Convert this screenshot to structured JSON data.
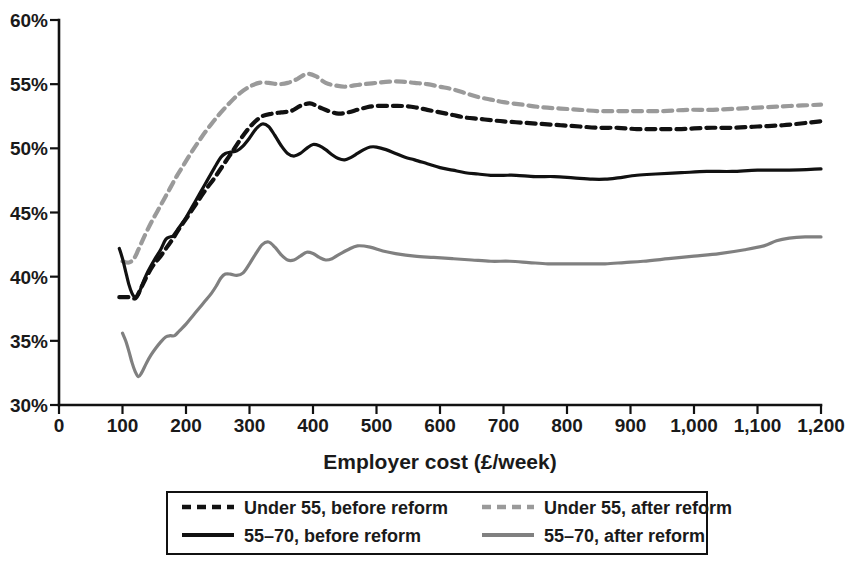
{
  "chart_data": {
    "type": "line",
    "title": "",
    "xlabel": "Employer cost (£/week)",
    "ylabel": "",
    "xlim": [
      0,
      1200
    ],
    "ylim": [
      30,
      60
    ],
    "grid": false,
    "legend_position": "bottom",
    "x_ticks": [
      0,
      100,
      200,
      300,
      400,
      500,
      600,
      700,
      800,
      900,
      1000,
      1100,
      1200
    ],
    "x_tick_labels": [
      "0",
      "100",
      "200",
      "300",
      "400",
      "500",
      "600",
      "700",
      "800",
      "900",
      "1,000",
      "1,100",
      "1,200"
    ],
    "y_ticks": [
      30,
      35,
      40,
      45,
      50,
      55,
      60
    ],
    "y_tick_labels": [
      "30%",
      "35%",
      "40%",
      "45%",
      "50%",
      "55%",
      "60%"
    ],
    "series": [
      {
        "name": "Under 55, before reform",
        "style": "dashed",
        "color": "#111111",
        "x": [
          95,
          100,
          110,
          118,
          122,
          130,
          140,
          150,
          160,
          170,
          180,
          190,
          200,
          215,
          230,
          245,
          260,
          275,
          290,
          305,
          320,
          335,
          350,
          365,
          380,
          395,
          410,
          425,
          440,
          455,
          470,
          485,
          500,
          520,
          540,
          560,
          580,
          600,
          620,
          640,
          660,
          680,
          700,
          730,
          760,
          790,
          820,
          850,
          880,
          910,
          940,
          980,
          1020,
          1060,
          1100,
          1140,
          1180,
          1200
        ],
        "y": [
          38.4,
          38.4,
          38.4,
          38.3,
          38.4,
          39.2,
          40.2,
          41.0,
          41.6,
          42.3,
          43.0,
          43.8,
          44.5,
          45.6,
          46.7,
          47.7,
          48.8,
          49.9,
          51.0,
          51.9,
          52.5,
          52.7,
          52.8,
          52.9,
          53.3,
          53.5,
          53.2,
          52.9,
          52.7,
          52.8,
          53.0,
          53.2,
          53.3,
          53.3,
          53.3,
          53.2,
          53.0,
          52.8,
          52.6,
          52.4,
          52.3,
          52.2,
          52.1,
          52.0,
          51.9,
          51.8,
          51.7,
          51.6,
          51.6,
          51.5,
          51.5,
          51.5,
          51.6,
          51.6,
          51.7,
          51.8,
          52.0,
          52.1
        ]
      },
      {
        "name": "Under 55, after reform",
        "style": "dashed",
        "color": "#9a9a9a",
        "x": [
          100,
          110,
          118,
          125,
          135,
          145,
          155,
          165,
          175,
          185,
          195,
          210,
          225,
          240,
          255,
          270,
          285,
          300,
          315,
          330,
          345,
          360,
          375,
          390,
          405,
          420,
          435,
          450,
          465,
          480,
          500,
          520,
          540,
          560,
          580,
          600,
          620,
          640,
          660,
          680,
          700,
          730,
          760,
          790,
          820,
          850,
          880,
          910,
          950,
          990,
          1030,
          1070,
          1110,
          1150,
          1200
        ],
        "y": [
          41.2,
          41.1,
          41.4,
          42.1,
          43.2,
          44.2,
          45.1,
          46.0,
          46.9,
          47.8,
          48.6,
          49.8,
          50.9,
          51.9,
          52.8,
          53.6,
          54.3,
          54.8,
          55.1,
          55.1,
          55.0,
          55.1,
          55.4,
          55.8,
          55.6,
          55.1,
          54.9,
          54.8,
          54.9,
          55.0,
          55.1,
          55.2,
          55.2,
          55.1,
          55.0,
          54.8,
          54.6,
          54.3,
          54.0,
          53.8,
          53.6,
          53.4,
          53.2,
          53.1,
          53.0,
          52.9,
          52.9,
          52.9,
          52.9,
          53.0,
          53.0,
          53.1,
          53.2,
          53.3,
          53.4
        ]
      },
      {
        "name": "55–70, before reform",
        "style": "solid",
        "color": "#111111",
        "x": [
          95,
          100,
          105,
          110,
          115,
          120,
          125,
          132,
          140,
          150,
          160,
          168,
          175,
          180,
          190,
          200,
          215,
          230,
          245,
          255,
          262,
          270,
          280,
          290,
          300,
          310,
          320,
          330,
          340,
          350,
          360,
          370,
          380,
          390,
          400,
          410,
          420,
          430,
          440,
          450,
          460,
          470,
          480,
          490,
          500,
          515,
          530,
          545,
          560,
          580,
          600,
          620,
          640,
          660,
          680,
          700,
          720,
          750,
          780,
          810,
          840,
          860,
          880,
          910,
          940,
          980,
          1020,
          1060,
          1100,
          1150,
          1200
        ],
        "y": [
          42.2,
          41.4,
          40.4,
          39.4,
          38.7,
          38.4,
          38.6,
          39.5,
          40.4,
          41.3,
          42.1,
          42.9,
          43.1,
          43.2,
          43.9,
          44.6,
          45.9,
          47.2,
          48.5,
          49.3,
          49.6,
          49.7,
          49.8,
          50.2,
          50.8,
          51.5,
          51.9,
          51.7,
          51.0,
          50.2,
          49.6,
          49.4,
          49.6,
          50.0,
          50.3,
          50.2,
          49.9,
          49.5,
          49.2,
          49.1,
          49.3,
          49.6,
          49.9,
          50.1,
          50.1,
          49.9,
          49.6,
          49.3,
          49.1,
          48.8,
          48.5,
          48.3,
          48.1,
          48.0,
          47.9,
          47.9,
          47.9,
          47.8,
          47.8,
          47.7,
          47.6,
          47.6,
          47.7,
          47.9,
          48.0,
          48.1,
          48.2,
          48.2,
          48.3,
          48.3,
          48.4
        ]
      },
      {
        "name": "55–70, after reform",
        "style": "solid",
        "color": "#808080",
        "x": [
          100,
          105,
          110,
          115,
          120,
          125,
          130,
          138,
          145,
          152,
          160,
          168,
          175,
          182,
          190,
          200,
          210,
          220,
          230,
          240,
          248,
          255,
          262,
          270,
          280,
          290,
          300,
          310,
          320,
          330,
          340,
          350,
          360,
          370,
          380,
          390,
          400,
          410,
          420,
          430,
          440,
          455,
          470,
          490,
          510,
          530,
          560,
          590,
          620,
          650,
          680,
          710,
          740,
          770,
          800,
          830,
          860,
          890,
          920,
          960,
          1000,
          1040,
          1080,
          1110,
          1130,
          1150,
          1175,
          1200
        ],
        "y": [
          35.6,
          35.0,
          34.2,
          33.3,
          32.6,
          32.2,
          32.5,
          33.3,
          33.9,
          34.4,
          34.9,
          35.3,
          35.4,
          35.4,
          35.8,
          36.3,
          36.9,
          37.5,
          38.1,
          38.7,
          39.3,
          39.9,
          40.2,
          40.2,
          40.1,
          40.3,
          41.0,
          41.8,
          42.5,
          42.7,
          42.3,
          41.7,
          41.3,
          41.3,
          41.6,
          41.9,
          41.8,
          41.5,
          41.3,
          41.4,
          41.7,
          42.1,
          42.4,
          42.3,
          42.0,
          41.8,
          41.6,
          41.5,
          41.4,
          41.3,
          41.2,
          41.2,
          41.1,
          41.0,
          41.0,
          41.0,
          41.0,
          41.1,
          41.2,
          41.4,
          41.6,
          41.8,
          42.1,
          42.4,
          42.8,
          43.0,
          43.1,
          43.1
        ]
      }
    ]
  },
  "legend": {
    "entries": [
      {
        "label": "Under 55, before reform",
        "style": "dashed",
        "color": "#111111"
      },
      {
        "label": "Under 55, after reform",
        "style": "dashed",
        "color": "#9a9a9a"
      },
      {
        "label": "55–70, before reform",
        "style": "solid",
        "color": "#111111"
      },
      {
        "label": "55–70, after reform",
        "style": "solid",
        "color": "#808080"
      }
    ]
  },
  "axis": {
    "x_title": "Employer cost (£/week)"
  }
}
